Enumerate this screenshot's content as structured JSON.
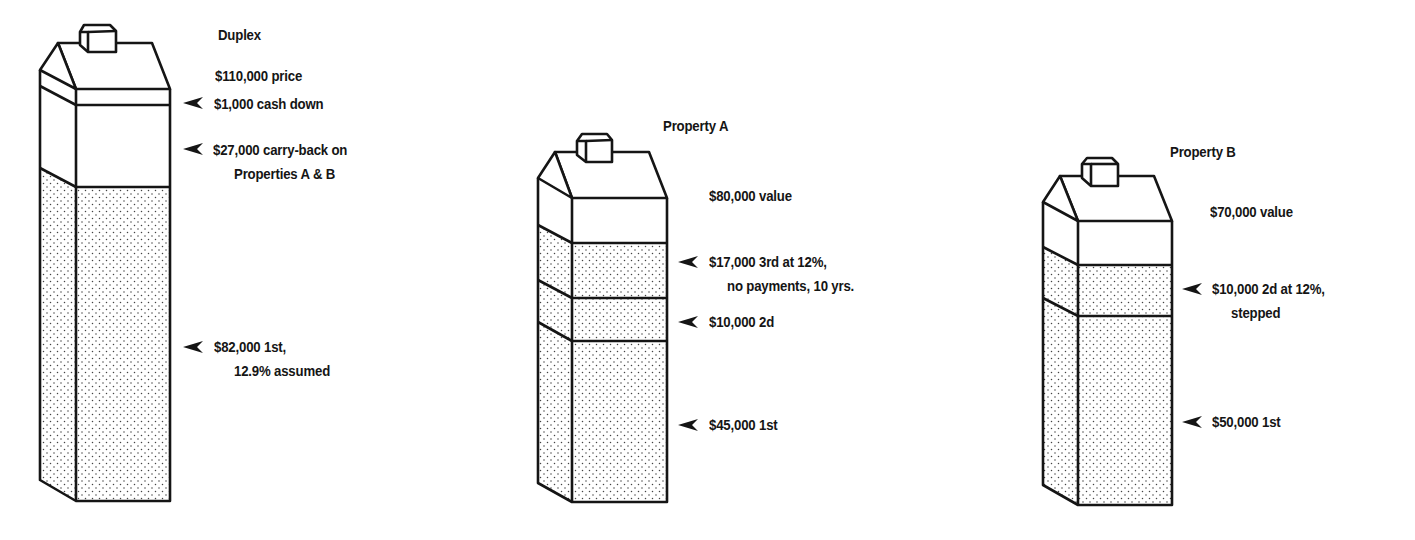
{
  "diagram": {
    "type": "financing-structure-illustration",
    "buildings": [
      {
        "name": "Duplex",
        "labels": {
          "title": "Duplex",
          "top": "$110,000 price",
          "segments": [
            {
              "line1": "$1,000 cash down",
              "line2": ""
            },
            {
              "line1": "$27,000 carry-back on",
              "line2": "Properties A & B"
            },
            {
              "line1": "$82,000 1st,",
              "line2": "12.9% assumed"
            }
          ]
        }
      },
      {
        "name": "Property A",
        "labels": {
          "title": "Property A",
          "top": "$80,000 value",
          "segments": [
            {
              "line1": "$17,000 3rd at 12%,",
              "line2": "no payments, 10 yrs."
            },
            {
              "line1": "$10,000 2d",
              "line2": ""
            },
            {
              "line1": "$45,000 1st",
              "line2": ""
            }
          ]
        }
      },
      {
        "name": "Property B",
        "labels": {
          "title": "Property B",
          "top": "$70,000 value",
          "segments": [
            {
              "line1": "$10,000 2d at 12%,",
              "line2": "stepped"
            },
            {
              "line1": "$50,000 1st",
              "line2": ""
            }
          ]
        }
      }
    ]
  },
  "colors": {
    "ink": "#151515",
    "paper": "#ffffff",
    "stipple": "#444444"
  }
}
